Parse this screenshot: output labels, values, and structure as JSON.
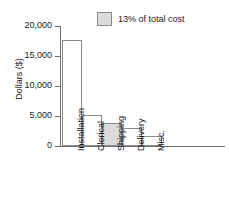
{
  "chart_data": {
    "type": "bar",
    "title": "",
    "xlabel": "",
    "ylabel": "Dollars ($)",
    "categories": [
      "Installation",
      "Clerical",
      "Shipping",
      "Delivery",
      "Misc."
    ],
    "values": [
      17700,
      5200,
      3900,
      2950,
      1750
    ],
    "ylim": [
      0,
      20000
    ],
    "yticks": [
      0,
      5000,
      10000,
      15000,
      20000
    ],
    "ytick_labels": [
      "0",
      "5,000",
      "10,000",
      "15,000",
      "20,000"
    ],
    "grid": false,
    "legend": {
      "position": "top-right",
      "entries": [
        {
          "label": "13% of total cost",
          "swatch_color": "#dcdcdc",
          "swatch_border": "#8a8a8a",
          "applies_to": "Shipping"
        }
      ]
    },
    "highlighted_category": "Shipping",
    "bar_fill": "#ffffff",
    "bar_border": "#8a8a8a",
    "axis_color": "#6f6f6f",
    "text_color": "#1a1a1a",
    "background": "#ffffff"
  }
}
